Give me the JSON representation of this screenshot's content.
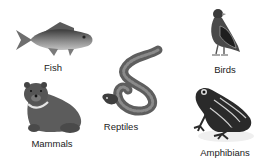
{
  "animals": [
    {
      "id": "fish",
      "label": "Fish"
    },
    {
      "id": "birds",
      "label": "Birds"
    },
    {
      "id": "reptiles",
      "label": "Reptiles"
    },
    {
      "id": "mammals",
      "label": "Mammals"
    },
    {
      "id": "amphibians",
      "label": "Amphibians"
    }
  ],
  "colors": {
    "background": "#ffffff",
    "label": "#222222",
    "illustration_dark": "#2e2e2e",
    "illustration_mid": "#6a6a6a",
    "illustration_light": "#a8a8a8"
  }
}
